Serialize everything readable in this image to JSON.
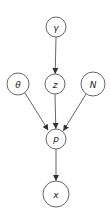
{
  "diagram": {
    "type": "bayesian-network",
    "colors": {
      "stroke": "#555555",
      "fill": "#ffffff",
      "text": "#222222"
    },
    "nodes": [
      {
        "id": "gamma",
        "label": "γ",
        "cx": 56,
        "cy": 27,
        "r": 10
      },
      {
        "id": "theta",
        "label": "θ",
        "cx": 18,
        "cy": 84,
        "r": 11
      },
      {
        "id": "z",
        "label": "z",
        "cx": 55,
        "cy": 84,
        "r": 10
      },
      {
        "id": "N",
        "label": "N",
        "cx": 93,
        "cy": 84,
        "r": 12
      },
      {
        "id": "p",
        "label": "p",
        "cx": 56,
        "cy": 139,
        "r": 10
      },
      {
        "id": "x",
        "label": "x",
        "cx": 56,
        "cy": 194,
        "r": 13
      }
    ],
    "edges": [
      {
        "from": "gamma",
        "to": "z"
      },
      {
        "from": "theta",
        "to": "p"
      },
      {
        "from": "z",
        "to": "p"
      },
      {
        "from": "N",
        "to": "p"
      },
      {
        "from": "p",
        "to": "x"
      }
    ]
  }
}
